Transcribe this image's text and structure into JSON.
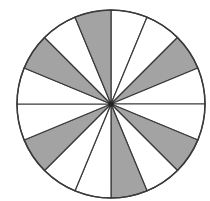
{
  "diagram": {
    "type": "fraction-circle",
    "total_sectors": 16,
    "shaded_sectors": [
      2,
      5,
      7,
      10,
      13,
      15
    ],
    "shaded_count": 6,
    "sector_angle_deg": 22.5,
    "start_angle_deg": 0,
    "direction": "clockwise-from-top",
    "center": [
      111,
      104
    ],
    "radius": 94,
    "colors": {
      "shaded": "#a3a3a3",
      "unshaded": "#ffffff",
      "stroke": "#3a3a3a",
      "center_dot": "#222222"
    }
  }
}
